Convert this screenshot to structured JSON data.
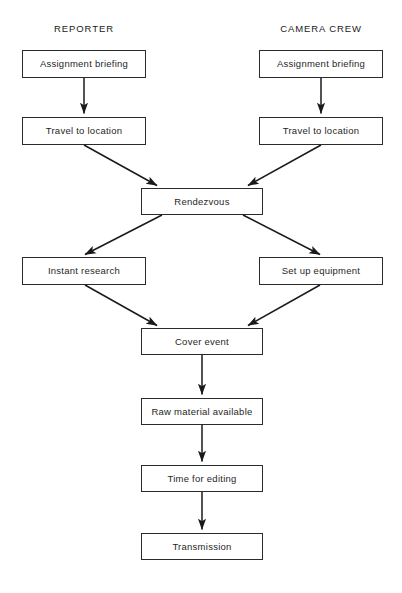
{
  "diagram": {
    "columns": [
      {
        "id": "reporter",
        "label": "REPORTER"
      },
      {
        "id": "camera-crew",
        "label": "CAMERA CREW"
      }
    ],
    "nodes": [
      {
        "id": "reporter-assignment-briefing",
        "label": "Assignment briefing",
        "lane": "reporter",
        "x": 22,
        "y": 50,
        "w": 124,
        "h": 28
      },
      {
        "id": "crew-assignment-briefing",
        "label": "Assignment briefing",
        "lane": "camera-crew",
        "x": 259,
        "y": 50,
        "w": 124,
        "h": 28
      },
      {
        "id": "reporter-travel-to-location",
        "label": "Travel to location",
        "lane": "reporter",
        "x": 22,
        "y": 117,
        "w": 124,
        "h": 28
      },
      {
        "id": "crew-travel-to-location",
        "label": "Travel to location",
        "lane": "camera-crew",
        "x": 259,
        "y": 117,
        "w": 124,
        "h": 28
      },
      {
        "id": "rendezvous",
        "label": "Rendezvous",
        "lane": "both",
        "x": 141,
        "y": 188,
        "w": 122,
        "h": 27
      },
      {
        "id": "instant-research",
        "label": "Instant research",
        "lane": "reporter",
        "x": 22,
        "y": 257,
        "w": 124,
        "h": 28
      },
      {
        "id": "set-up-equipment",
        "label": "Set up equipment",
        "lane": "camera-crew",
        "x": 259,
        "y": 257,
        "w": 124,
        "h": 28
      },
      {
        "id": "cover-event",
        "label": "Cover event",
        "lane": "both",
        "x": 141,
        "y": 328,
        "w": 122,
        "h": 27
      },
      {
        "id": "raw-material-available",
        "label": "Raw material available",
        "lane": "both",
        "x": 141,
        "y": 398,
        "w": 122,
        "h": 27
      },
      {
        "id": "time-for-editing",
        "label": "Time for editing",
        "lane": "both",
        "x": 141,
        "y": 465,
        "w": 122,
        "h": 27
      },
      {
        "id": "transmission",
        "label": "Transmission",
        "lane": "both",
        "x": 141,
        "y": 533,
        "w": 122,
        "h": 27
      }
    ],
    "edges": [
      {
        "id": "edge-reporter-briefing-to-travel",
        "from": "reporter-assignment-briefing",
        "to": "reporter-travel-to-location",
        "kind": "vertical"
      },
      {
        "id": "edge-crew-briefing-to-travel",
        "from": "crew-assignment-briefing",
        "to": "crew-travel-to-location",
        "kind": "vertical"
      },
      {
        "id": "edge-reporter-travel-to-rendezvous",
        "from": "reporter-travel-to-location",
        "to": "rendezvous",
        "kind": "diagonal"
      },
      {
        "id": "edge-crew-travel-to-rendezvous",
        "from": "crew-travel-to-location",
        "to": "rendezvous",
        "kind": "diagonal"
      },
      {
        "id": "edge-rendezvous-to-instant-research",
        "from": "rendezvous",
        "to": "instant-research",
        "kind": "diagonal"
      },
      {
        "id": "edge-rendezvous-to-set-up-equipment",
        "from": "rendezvous",
        "to": "set-up-equipment",
        "kind": "diagonal"
      },
      {
        "id": "edge-instant-research-to-cover-event",
        "from": "instant-research",
        "to": "cover-event",
        "kind": "diagonal"
      },
      {
        "id": "edge-set-up-equipment-to-cover-event",
        "from": "set-up-equipment",
        "to": "cover-event",
        "kind": "diagonal"
      },
      {
        "id": "edge-cover-event-to-raw-material",
        "from": "cover-event",
        "to": "raw-material-available",
        "kind": "vertical"
      },
      {
        "id": "edge-raw-material-to-time-editing",
        "from": "raw-material-available",
        "to": "time-for-editing",
        "kind": "vertical"
      },
      {
        "id": "edge-time-editing-to-transmission",
        "from": "time-for-editing",
        "to": "transmission",
        "kind": "vertical"
      }
    ],
    "style": {
      "line_color": "#1a1a1a",
      "box_border_color": "#2b2b2b",
      "box_fill": "#ffffff",
      "text_color": "#1f1f1f",
      "background": "#ffffff"
    }
  }
}
